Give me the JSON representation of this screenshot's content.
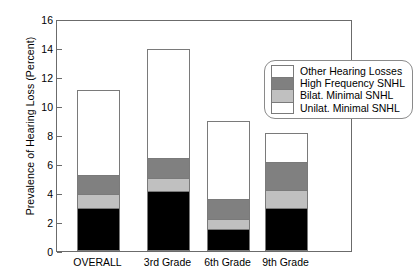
{
  "chart_data": {
    "type": "bar",
    "subtype": "stacked-vertical",
    "title": "",
    "xlabel": "",
    "ylabel": "Prevalence of Hearing Loss (Percent)",
    "ylim": [
      0,
      16
    ],
    "yticks": [
      0,
      2,
      4,
      6,
      8,
      10,
      12,
      14,
      16
    ],
    "ytick_labels": [
      "0",
      "2",
      "4",
      "6",
      "8",
      "10",
      "12",
      "14",
      "16"
    ],
    "grid": false,
    "legend_position": "upper right (inside plot)",
    "categories": [
      "OVERALL",
      "3rd Grade",
      "6th Grade",
      "9th Grade"
    ],
    "series": [
      {
        "name": "Unilat. Minimal SNHL",
        "color": "#000000",
        "values": [
          3.0,
          4.15,
          1.5,
          3.0
        ]
      },
      {
        "name": "Bilat. Minimal SNHL",
        "color": "#c0c0c0",
        "values": [
          1.0,
          0.95,
          0.8,
          1.25
        ]
      },
      {
        "name": "High Frequency SNHL",
        "color": "#808080",
        "values": [
          1.4,
          1.45,
          1.45,
          2.0
        ]
      },
      {
        "name": "Other Hearing Losses",
        "color": "#ffffff",
        "values": [
          5.9,
          7.6,
          5.45,
          2.1
        ]
      }
    ],
    "stack_order_bottom_to_top": [
      "Unilat. Minimal SNHL",
      "Bilat. Minimal SNHL",
      "High Frequency SNHL",
      "Other Hearing Losses"
    ],
    "totals": [
      11.3,
      14.15,
      9.2,
      8.35
    ],
    "cumulative_tops": {
      "OVERALL": [
        3.0,
        4.0,
        5.4,
        11.3
      ],
      "3rd Grade": [
        4.15,
        5.1,
        6.55,
        14.15
      ],
      "6th Grade": [
        1.5,
        2.3,
        3.75,
        9.2
      ],
      "9th Grade": [
        3.0,
        4.25,
        6.25,
        8.35
      ]
    }
  },
  "legend": {
    "entries": [
      {
        "label": "Other Hearing Losses",
        "swatch_color": "#ffffff"
      },
      {
        "label": "High Frequency SNHL",
        "swatch_color": "#808080"
      },
      {
        "label": "Bilat. Minimal SNHL",
        "swatch_color": "#c0c0c0"
      },
      {
        "label": "Unilat. Minimal SNHL",
        "swatch_color": "#ffffff"
      }
    ]
  },
  "colors": {
    "axis": "#6b6b6b",
    "outline": "#7a7a7a",
    "black_segment": "#000000",
    "dark_gray_segment": "#808080",
    "light_gray_segment": "#c0c0c0",
    "white_segment": "#ffffff",
    "background": "#ffffff"
  }
}
